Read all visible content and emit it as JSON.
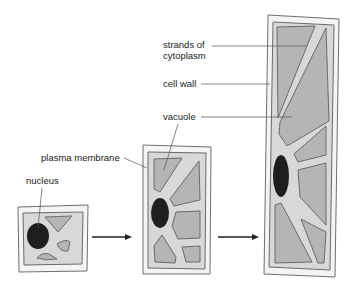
{
  "diagram": {
    "labels": {
      "nucleus": "nucleus",
      "plasma_membrane": "plasma membrane",
      "vacuole": "vacuole",
      "cell_wall": "cell wall",
      "strands_line1": "strands of",
      "strands_line2": "cytoplasm"
    },
    "stages": [
      "small young cell",
      "enlarging cell",
      "mature elongated cell"
    ],
    "colors": {
      "cell_wall_fill": "#f4f4f4",
      "cytoplasm_fill": "#d8d8d8",
      "vacuole_fill": "#b5b5b5",
      "nucleus_fill": "#1e1e1e",
      "outline": "#6a6a6a"
    }
  }
}
